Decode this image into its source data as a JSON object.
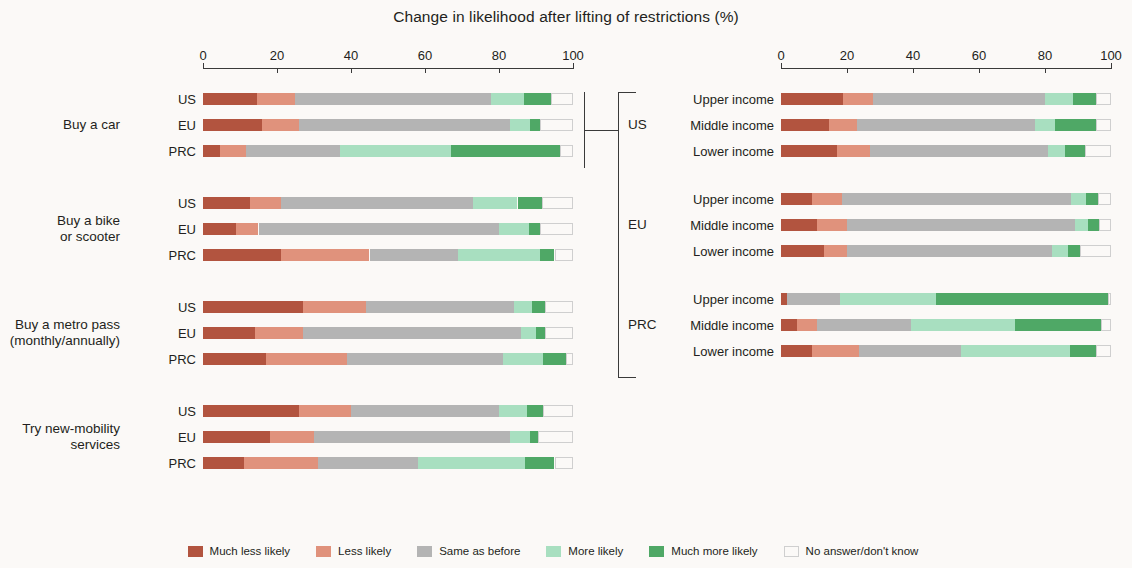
{
  "title": "Change in likelihood after lifting of restrictions (%)",
  "axis": {
    "ticks": [
      0,
      20,
      40,
      60,
      80,
      100
    ],
    "min": 0,
    "max": 100
  },
  "legend": [
    {
      "label": "Much less likely",
      "color": "#b2543f",
      "key": "much_less"
    },
    {
      "label": "Less likely",
      "color": "#e0927c",
      "key": "less"
    },
    {
      "label": "Same as before",
      "color": "#b4b4b4",
      "key": "same"
    },
    {
      "label": "More likely",
      "color": "#a8dfc0",
      "key": "more"
    },
    {
      "label": "Much more likely",
      "color": "#4fa866",
      "key": "much_more"
    },
    {
      "label": "No answer/don't know",
      "color": "#ffffff",
      "key": "no_answer"
    }
  ],
  "left_panel": {
    "groups": [
      {
        "label": "Buy a car",
        "rows": [
          {
            "label": "US",
            "values": [
              14.7,
              10.1,
              53.0,
              9.0,
              7.2,
              6.0
            ]
          },
          {
            "label": "EU",
            "values": [
              16.0,
              10.0,
              57.0,
              5.5,
              2.5,
              9.0
            ]
          },
          {
            "label": "PRC",
            "values": [
              4.5,
              7.0,
              25.5,
              30.0,
              29.5,
              3.5
            ]
          }
        ]
      },
      {
        "label": "Buy a bike\nor scooter",
        "rows": [
          {
            "label": "US",
            "values": [
              12.7,
              8.3,
              52.0,
              12.0,
              6.5,
              8.5
            ]
          },
          {
            "label": "EU",
            "values": [
              9.0,
              6.0,
              65.0,
              8.0,
              3.0,
              9.0
            ]
          },
          {
            "label": "PRC",
            "values": [
              21.0,
              24.0,
              24.0,
              22.0,
              4.0,
              5.0
            ]
          }
        ]
      },
      {
        "label": "Buy a metro pass\n(monthly/annually)",
        "rows": [
          {
            "label": "US",
            "values": [
              27.0,
              17.0,
              40.0,
              5.0,
              3.5,
              7.5
            ]
          },
          {
            "label": "EU",
            "values": [
              14.0,
              13.0,
              59.0,
              4.0,
              2.5,
              7.5
            ]
          },
          {
            "label": "PRC",
            "values": [
              17.0,
              22.0,
              42.0,
              11.0,
              6.0,
              2.0
            ]
          }
        ]
      },
      {
        "label": "Try new-mobility\nservices",
        "rows": [
          {
            "label": "US",
            "values": [
              26.0,
              14.0,
              40.0,
              7.5,
              4.5,
              8.0
            ]
          },
          {
            "label": "EU",
            "values": [
              18.0,
              12.0,
              53.0,
              5.5,
              2.0,
              9.5
            ]
          },
          {
            "label": "PRC",
            "values": [
              11.0,
              20.0,
              27.0,
              29.0,
              8.0,
              5.0
            ]
          }
        ]
      }
    ]
  },
  "right_panel": {
    "groups": [
      {
        "label": "US",
        "rows": [
          {
            "label": "Upper income",
            "values": [
              18.7,
              9.3,
              52.0,
              8.5,
              7.0,
              4.5
            ]
          },
          {
            "label": "Middle income",
            "values": [
              14.5,
              8.5,
              54.0,
              6.0,
              12.5,
              4.5
            ]
          },
          {
            "label": "Lower income",
            "values": [
              17.0,
              10.0,
              54.0,
              5.0,
              6.0,
              8.0
            ]
          }
        ]
      },
      {
        "label": "EU",
        "rows": [
          {
            "label": "Upper income",
            "values": [
              9.5,
              9.0,
              69.5,
              4.5,
              3.5,
              4.0
            ]
          },
          {
            "label": "Middle income",
            "values": [
              11.0,
              9.0,
              69.0,
              4.0,
              3.5,
              3.5
            ]
          },
          {
            "label": "Lower income",
            "values": [
              13.0,
              7.0,
              62.0,
              5.0,
              3.5,
              9.5
            ]
          }
        ]
      },
      {
        "label": "PRC",
        "rows": [
          {
            "label": "Upper income",
            "values": [
              1.8,
              0.0,
              16.2,
              29.0,
              52.0,
              1.0
            ]
          },
          {
            "label": "Middle income",
            "values": [
              4.8,
              6.2,
              28.5,
              31.5,
              26.0,
              3.0
            ]
          },
          {
            "label": "Lower income",
            "values": [
              9.5,
              14.0,
              31.0,
              33.0,
              8.0,
              4.5
            ]
          }
        ]
      }
    ]
  },
  "chart_data": {
    "type": "bar",
    "subtype": "stacked-horizontal-100",
    "title": "Change in likelihood after lifting of restrictions (%)",
    "xlabel": "",
    "ylabel": "",
    "xlim": [
      0,
      100
    ],
    "xticks": [
      0,
      20,
      40,
      60,
      80,
      100
    ],
    "grid": false,
    "legend_position": "bottom-center",
    "series": [
      {
        "name": "Much less likely",
        "color": "#b2543f"
      },
      {
        "name": "Less likely",
        "color": "#e0927c"
      },
      {
        "name": "Same as before",
        "color": "#b4b4b4"
      },
      {
        "name": "More likely",
        "color": "#a8dfc0"
      },
      {
        "name": "Much more likely",
        "color": "#4fa866"
      },
      {
        "name": "No answer/don't know",
        "color": "#ffffff"
      }
    ],
    "panels": [
      {
        "name": "By activity and region",
        "rows": [
          {
            "group": "Buy a car",
            "category": "US",
            "values": [
              14.7,
              10.1,
              53.0,
              9.0,
              7.2,
              6.0
            ]
          },
          {
            "group": "Buy a car",
            "category": "EU",
            "values": [
              16.0,
              10.0,
              57.0,
              5.5,
              2.5,
              9.0
            ]
          },
          {
            "group": "Buy a car",
            "category": "PRC",
            "values": [
              4.5,
              7.0,
              25.5,
              30.0,
              29.5,
              3.5
            ]
          },
          {
            "group": "Buy a bike or scooter",
            "category": "US",
            "values": [
              12.7,
              8.3,
              52.0,
              12.0,
              6.5,
              8.5
            ]
          },
          {
            "group": "Buy a bike or scooter",
            "category": "EU",
            "values": [
              9.0,
              6.0,
              65.0,
              8.0,
              3.0,
              9.0
            ]
          },
          {
            "group": "Buy a bike or scooter",
            "category": "PRC",
            "values": [
              21.0,
              24.0,
              24.0,
              22.0,
              4.0,
              5.0
            ]
          },
          {
            "group": "Buy a metro pass (monthly/annually)",
            "category": "US",
            "values": [
              27.0,
              17.0,
              40.0,
              5.0,
              3.5,
              7.5
            ]
          },
          {
            "group": "Buy a metro pass (monthly/annually)",
            "category": "EU",
            "values": [
              14.0,
              13.0,
              59.0,
              4.0,
              2.5,
              7.5
            ]
          },
          {
            "group": "Buy a metro pass (monthly/annually)",
            "category": "PRC",
            "values": [
              17.0,
              22.0,
              42.0,
              11.0,
              6.0,
              2.0
            ]
          },
          {
            "group": "Try new-mobility services",
            "category": "US",
            "values": [
              26.0,
              14.0,
              40.0,
              7.5,
              4.5,
              8.0
            ]
          },
          {
            "group": "Try new-mobility services",
            "category": "EU",
            "values": [
              18.0,
              12.0,
              53.0,
              5.5,
              2.0,
              9.5
            ]
          },
          {
            "group": "Try new-mobility services",
            "category": "PRC",
            "values": [
              11.0,
              20.0,
              27.0,
              29.0,
              8.0,
              5.0
            ]
          }
        ]
      },
      {
        "name": "Buy a car, by region and income",
        "rows": [
          {
            "group": "US",
            "category": "Upper income",
            "values": [
              18.7,
              9.3,
              52.0,
              8.5,
              7.0,
              4.5
            ]
          },
          {
            "group": "US",
            "category": "Middle income",
            "values": [
              14.5,
              8.5,
              54.0,
              6.0,
              12.5,
              4.5
            ]
          },
          {
            "group": "US",
            "category": "Lower income",
            "values": [
              17.0,
              10.0,
              54.0,
              5.0,
              6.0,
              8.0
            ]
          },
          {
            "group": "EU",
            "category": "Upper income",
            "values": [
              9.5,
              9.0,
              69.5,
              4.5,
              3.5,
              4.0
            ]
          },
          {
            "group": "EU",
            "category": "Middle income",
            "values": [
              11.0,
              9.0,
              69.0,
              4.0,
              3.5,
              3.5
            ]
          },
          {
            "group": "EU",
            "category": "Lower income",
            "values": [
              13.0,
              7.0,
              62.0,
              5.0,
              3.5,
              9.5
            ]
          },
          {
            "group": "PRC",
            "category": "Upper income",
            "values": [
              1.8,
              0.0,
              16.2,
              29.0,
              52.0,
              1.0
            ]
          },
          {
            "group": "PRC",
            "category": "Middle income",
            "values": [
              4.8,
              6.2,
              28.5,
              31.5,
              26.0,
              3.0
            ]
          },
          {
            "group": "PRC",
            "category": "Lower income",
            "values": [
              9.5,
              14.0,
              31.0,
              33.0,
              8.0,
              4.5
            ]
          }
        ]
      }
    ]
  }
}
